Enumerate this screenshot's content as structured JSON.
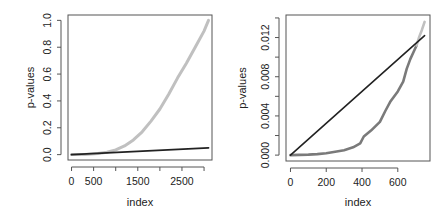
{
  "chart_data": [
    {
      "type": "line",
      "panel": "left",
      "title": "",
      "xlabel": "index",
      "ylabel": "p-values",
      "xlim": [
        -80,
        3180
      ],
      "ylim": [
        -0.04,
        1.04
      ],
      "xticks": [
        0,
        500,
        1000,
        1500,
        2000,
        2500,
        3000
      ],
      "xtick_labels": [
        "0",
        "500",
        "",
        "1500",
        "",
        "2500",
        ""
      ],
      "yticks": [
        0.0,
        0.2,
        0.4,
        0.6,
        0.8,
        1.0
      ],
      "ytick_labels": [
        "0.0",
        "0.2",
        "0.4",
        "0.6",
        "0.8",
        "1.0"
      ],
      "grid": false,
      "legend": null,
      "series": [
        {
          "name": "sorted p-values",
          "color": "#c0c0c0",
          "width": 3,
          "x": [
            0,
            300,
            600,
            800,
            1000,
            1200,
            1400,
            1600,
            1800,
            2000,
            2200,
            2400,
            2600,
            2800,
            3000,
            3100
          ],
          "y": [
            0.0,
            0.002,
            0.008,
            0.018,
            0.035,
            0.065,
            0.11,
            0.17,
            0.25,
            0.34,
            0.45,
            0.57,
            0.68,
            0.8,
            0.92,
            1.0
          ]
        },
        {
          "name": "BH threshold line",
          "color": "#222222",
          "width": 1.8,
          "x": [
            0,
            3100
          ],
          "y": [
            0.0,
            0.05
          ]
        }
      ]
    },
    {
      "type": "line",
      "panel": "right",
      "title": "",
      "xlabel": "index",
      "ylabel": "p-values",
      "xlim": [
        -25,
        780
      ],
      "ylim": [
        -0.0006,
        0.0143
      ],
      "xticks": [
        0,
        200,
        400,
        600
      ],
      "xtick_labels": [
        "0",
        "200",
        "400",
        "600"
      ],
      "yticks": [
        0.0,
        0.002,
        0.004,
        0.006,
        0.008,
        0.01,
        0.012,
        0.014
      ],
      "ytick_labels": [
        "0.000",
        "",
        "0.004",
        "",
        "0.008",
        "",
        "0.012",
        ""
      ],
      "grid": false,
      "legend": null,
      "series": [
        {
          "name": "sorted p-values (below threshold)",
          "color": "#7a7a7a",
          "width": 2.6,
          "x": [
            0,
            50,
            100,
            150,
            200,
            250,
            300,
            350,
            390,
            410,
            450,
            500,
            530,
            560,
            600,
            630,
            650,
            670,
            690,
            705
          ],
          "y": [
            0.0,
            2e-05,
            5e-05,
            0.0001,
            0.0002,
            0.00035,
            0.0005,
            0.0008,
            0.0012,
            0.0019,
            0.0025,
            0.0034,
            0.0045,
            0.0055,
            0.0065,
            0.0075,
            0.0088,
            0.0098,
            0.0106,
            0.0112
          ]
        },
        {
          "name": "sorted p-values (above threshold)",
          "color": "#c0c0c0",
          "width": 2.6,
          "x": [
            705,
            720,
            735,
            750
          ],
          "y": [
            0.0112,
            0.0121,
            0.0128,
            0.0136
          ]
        },
        {
          "name": "BH threshold line",
          "color": "#222222",
          "width": 1.6,
          "x": [
            0,
            750
          ],
          "y": [
            0.0,
            0.0122
          ]
        }
      ]
    }
  ]
}
